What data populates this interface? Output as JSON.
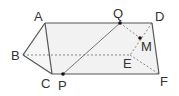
{
  "diagram": {
    "type": "triangular-prism",
    "points": {
      "A": {
        "label": "A",
        "x": 45,
        "y": 23
      },
      "B": {
        "label": "B",
        "x": 23,
        "y": 55
      },
      "C": {
        "label": "C",
        "x": 52,
        "y": 74
      },
      "D": {
        "label": "D",
        "x": 152,
        "y": 23
      },
      "E": {
        "label": "E",
        "x": 130,
        "y": 55
      },
      "F": {
        "label": "F",
        "x": 159,
        "y": 74
      },
      "P": {
        "label": "P",
        "x": 63,
        "y": 74
      },
      "Q": {
        "label": "Q",
        "x": 120,
        "y": 23
      },
      "M": {
        "label": "M",
        "x": 140,
        "y": 38
      }
    },
    "colors": {
      "stroke": "#555555",
      "hidden_stroke": "#888888",
      "fill": "#f0f0f0",
      "point": "#111111"
    }
  }
}
